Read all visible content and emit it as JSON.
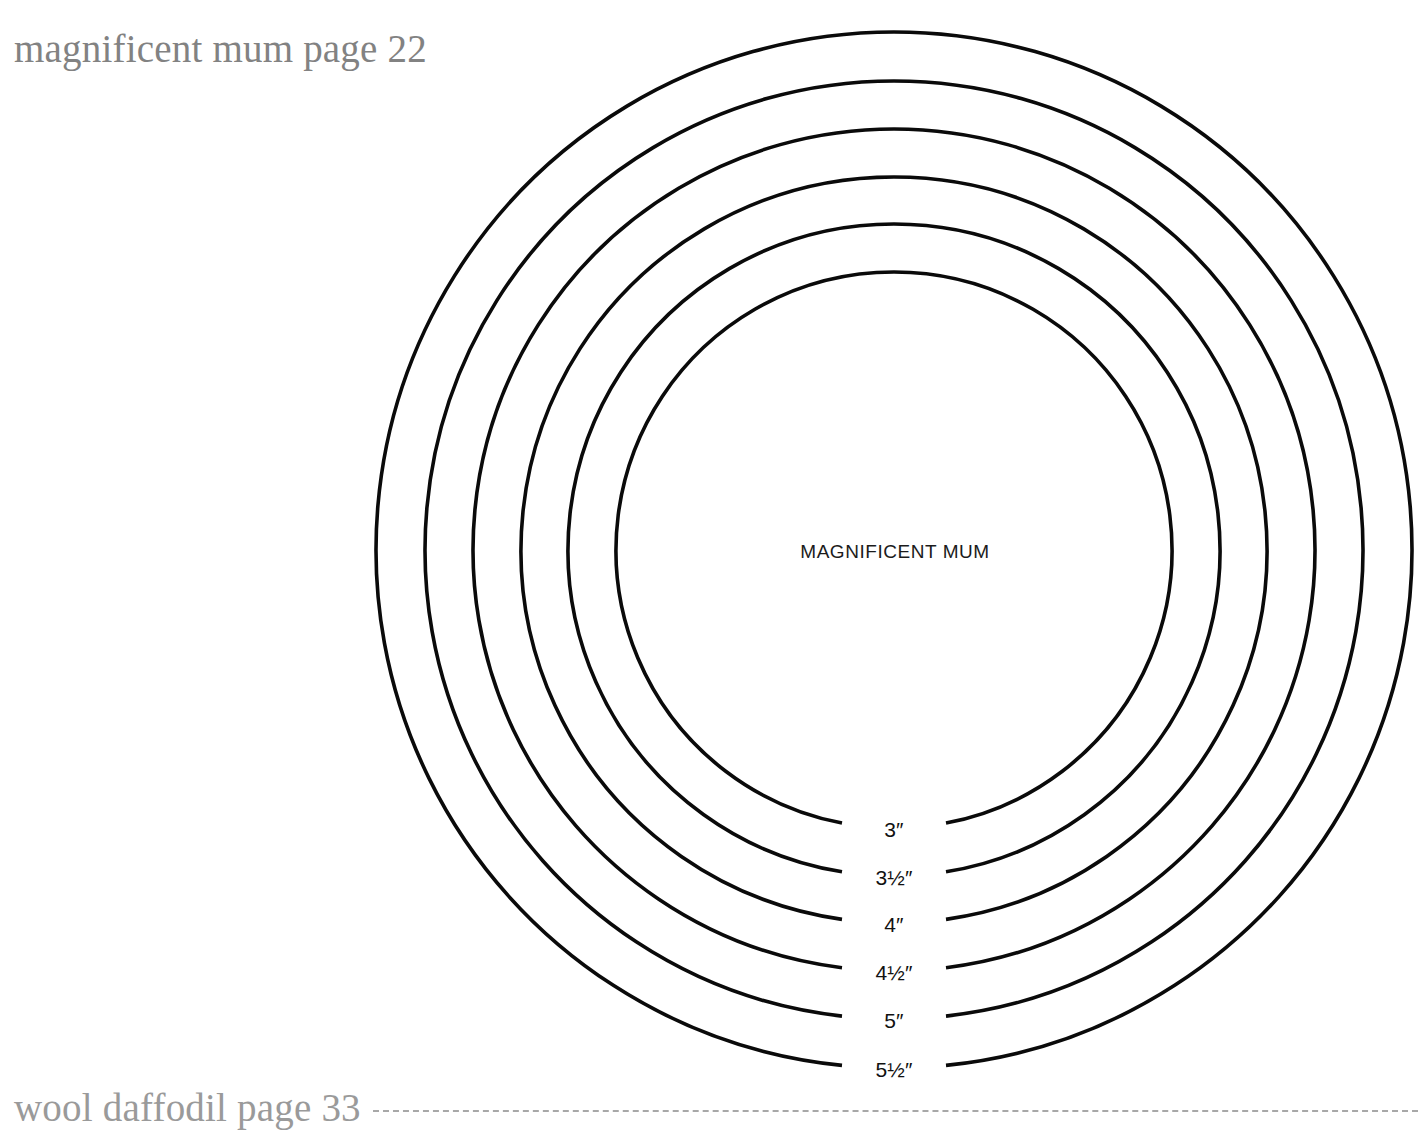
{
  "page": {
    "background_color": "#ffffff",
    "width": 1418,
    "height": 1121
  },
  "header": {
    "running_head": "magnificent mum page 22"
  },
  "footer": {
    "running_foot": "wool daffodil page 33",
    "rule_style": "dashed",
    "rule_color": "#a8a8a8"
  },
  "diagram": {
    "type": "concentric-circle-template",
    "center_label": "MAGNIFICENT MUM",
    "stroke_color": "#0a0a0a",
    "center_x": 894,
    "center_y": 550,
    "circles": [
      {
        "label": "3″",
        "size_inches": 3,
        "radius_px": 278,
        "label_x": 894,
        "label_y": 831
      },
      {
        "label": "3½″",
        "size_inches": 3.5,
        "radius_px": 326,
        "label_x": 894,
        "label_y": 879
      },
      {
        "label": "4″",
        "size_inches": 4,
        "radius_px": 373,
        "label_x": 894,
        "label_y": 926
      },
      {
        "label": "4½″",
        "size_inches": 4.5,
        "radius_px": 421,
        "label_x": 894,
        "label_y": 974
      },
      {
        "label": "5″",
        "size_inches": 5,
        "radius_px": 469,
        "label_x": 894,
        "label_y": 1022
      },
      {
        "label": "5½″",
        "size_inches": 5.5,
        "radius_px": 518,
        "label_x": 894,
        "label_y": 1071
      }
    ]
  },
  "chart_data": {
    "type": "concentric-circles",
    "title": "MAGNIFICENT MUM",
    "categories": [
      "3″",
      "3½″",
      "4″",
      "4½″",
      "5″",
      "5½″"
    ],
    "values": [
      3,
      3.5,
      4,
      4.5,
      5,
      5.5
    ],
    "radii_px": [
      278,
      326,
      373,
      421,
      469,
      518
    ],
    "xlabel": "",
    "ylabel": "diameter (inches)",
    "grid": false,
    "legend": "none"
  }
}
